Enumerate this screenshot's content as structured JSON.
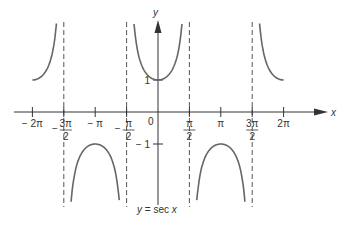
{
  "chart_data": {
    "type": "line",
    "title": "y = sec x",
    "xlabel": "x",
    "ylabel": "y",
    "function": "sec(x)",
    "xlim": [
      -6.283,
      6.283
    ],
    "ylim": [
      -3,
      3
    ],
    "x_ticks": [
      {
        "value": -6.2832,
        "label": "− 2π"
      },
      {
        "value": -4.7124,
        "label_num": "3π",
        "label_den": "2",
        "sign": "−"
      },
      {
        "value": -3.1416,
        "label": "− π"
      },
      {
        "value": -1.5708,
        "label_num": "π",
        "label_den": "2",
        "sign": "−"
      },
      {
        "value": 1.5708,
        "label_num": "π",
        "label_den": "2"
      },
      {
        "value": 3.1416,
        "label": "π"
      },
      {
        "value": 4.7124,
        "label_num": "3π",
        "label_den": "2"
      },
      {
        "value": 6.2832,
        "label": "2π"
      }
    ],
    "y_ticks": [
      {
        "value": 1,
        "label": "1"
      },
      {
        "value": -1,
        "label": "− 1"
      }
    ],
    "origin_label": "0",
    "asymptotes": [
      -4.7124,
      -1.5708,
      1.5708,
      4.7124
    ],
    "series": [
      {
        "name": "sec x",
        "branches": [
          {
            "x_range": [
              -6.283,
              -4.75
            ],
            "sign": "+"
          },
          {
            "x_range": [
              -4.68,
              -1.61
            ],
            "sign": "-"
          },
          {
            "x_range": [
              -1.53,
              1.53
            ],
            "sign": "+"
          },
          {
            "x_range": [
              1.61,
              4.68
            ],
            "sign": "-"
          },
          {
            "x_range": [
              4.75,
              6.283
            ],
            "sign": "+"
          }
        ]
      }
    ],
    "key_points": [
      {
        "x": 0,
        "y": 1
      },
      {
        "x": -3.1416,
        "y": -1
      },
      {
        "x": 3.1416,
        "y": -1
      },
      {
        "x": -6.2832,
        "y": 1
      },
      {
        "x": 6.2832,
        "y": 1
      }
    ],
    "grid": false,
    "legend": "none",
    "colors": {
      "curve": "#666666",
      "axis": "#333333",
      "asymptote": "#555555"
    }
  }
}
